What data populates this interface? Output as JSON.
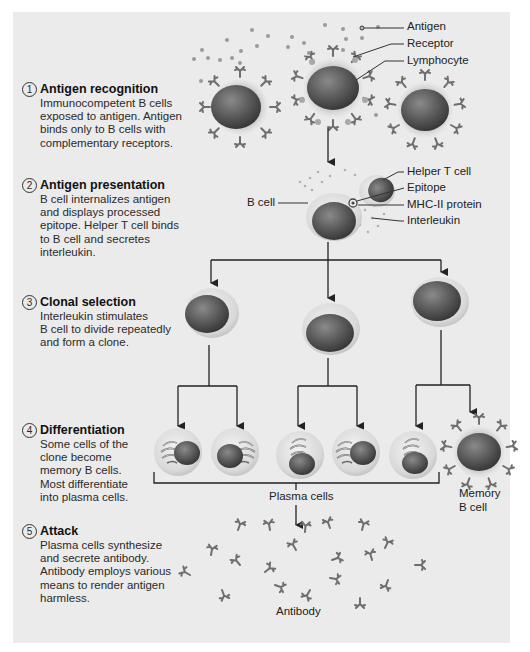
{
  "diagram": {
    "steps": [
      {
        "number": "1",
        "title": "Antigen recognition",
        "lines": [
          "Immunocompetent B cells",
          "exposed to antigen. Antigen",
          "binds only to B cells with",
          "complementary receptors."
        ]
      },
      {
        "number": "2",
        "title": "Antigen presentation",
        "lines": [
          "B cell internalizes antigen",
          "and displays processed",
          "epitope. Helper T cell binds",
          "to B cell and secretes",
          "interleukin."
        ]
      },
      {
        "number": "3",
        "title": "Clonal selection",
        "lines": [
          "Interleukin stimulates",
          "B cell to divide repeatedly",
          "and form a clone."
        ]
      },
      {
        "number": "4",
        "title": "Differentiation",
        "lines": [
          "Some cells of the",
          "clone become",
          "memory B cells.",
          "Most differentiate",
          "into plasma cells."
        ]
      },
      {
        "number": "5",
        "title": "Attack",
        "lines": [
          "Plasma cells synthesize",
          "and secrete antibody.",
          "Antibody employs various",
          "means to render antigen",
          "harmless."
        ]
      }
    ],
    "labels": {
      "antigen": "Antigen",
      "receptor": "Receptor",
      "lymphocyte": "Lymphocyte",
      "helper_t_cell": "Helper T cell",
      "epitope": "Epitope",
      "mhc_ii": "MHC-II protein",
      "interleukin": "Interleukin",
      "b_cell": "B cell",
      "plasma_cells": "Plasma cells",
      "memory_b_cell_1": "Memory",
      "memory_b_cell_2": "B cell",
      "antibody": "Antibody"
    },
    "colors": {
      "panel_bg": "#ebebeb",
      "nucleus": "#5a5a5a",
      "cytoplasm": "#cfcfcf",
      "receptor": "#6e6e6e",
      "antigen": "#9a9a9a",
      "line": "#222222"
    }
  }
}
